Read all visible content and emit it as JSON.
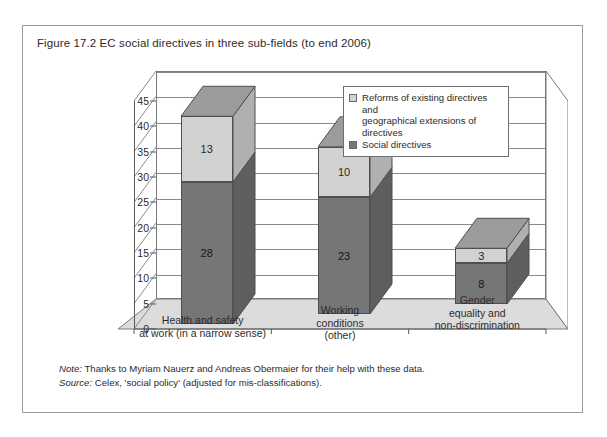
{
  "figure": {
    "title": "Figure 17.2  EC social directives in three sub-fields (to end 2006)",
    "note_label": "Note:",
    "note_text": " Thanks to Myriam Nauerz and Andreas Obermaier for their help with these data.",
    "source_label": "Source:",
    "source_text": " Celex, 'social policy' (adjusted for mis-classifications)."
  },
  "chart_data": {
    "type": "bar",
    "subtype": "stacked-column-3d",
    "title": "EC social directives in three sub-fields (to end 2006)",
    "xlabel": "",
    "ylabel": "",
    "ylim": [
      0,
      45
    ],
    "yticks": [
      0,
      5,
      10,
      15,
      20,
      25,
      30,
      35,
      40,
      45
    ],
    "grid": true,
    "legend_position": "top-right-inside",
    "categories": [
      "Health and safety\nat work (in a narrow sense)",
      "Working\nconditions\n(other)",
      "Gender\nequality and\nnon-discrimination"
    ],
    "category_lines": [
      [
        "Health and safety",
        "at work (in a narrow sense)"
      ],
      [
        "Working",
        "conditions",
        "(other)"
      ],
      [
        "Gender",
        "equality and",
        "non-discrimination"
      ]
    ],
    "series": [
      {
        "name": "Social directives",
        "color": "#767676",
        "values": [
          28,
          23,
          8
        ]
      },
      {
        "name": "Reforms of existing directives and geographical extensions of directives",
        "color": "#d2d2d2",
        "values": [
          13,
          10,
          3
        ]
      }
    ],
    "totals": [
      41,
      33,
      11
    ]
  },
  "legend": {
    "items": [
      {
        "line1": "Reforms of existing directives and",
        "line2": "geographical extensions of directives",
        "swatch": "light"
      },
      {
        "line1": "Social directives",
        "line2": "",
        "swatch": "dark"
      }
    ]
  },
  "colors": {
    "dark_face": "#767676",
    "light_face": "#d2d2d2",
    "dark_side": "#5e5e5e",
    "light_side": "#b0b0b0",
    "floor": "#dcdcdc",
    "border": "#9b9b9b"
  }
}
